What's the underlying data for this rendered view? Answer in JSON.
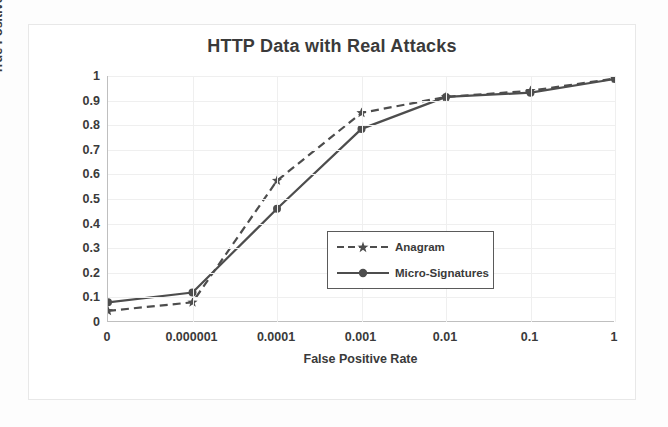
{
  "chart_data": {
    "type": "line",
    "title": "HTTP Data with Real Attacks",
    "xlabel": "False Positive Rate",
    "ylabel": "True Positive Rate",
    "x_tick_labels": [
      "0",
      "0.000001",
      "0.0001",
      "0.001",
      "0.01",
      "0.1",
      "1"
    ],
    "y_tick_labels": [
      "0",
      "0.1",
      "0.2",
      "0.3",
      "0.4",
      "0.5",
      "0.6",
      "0.7",
      "0.8",
      "0.9",
      "1"
    ],
    "y_ticks": [
      0,
      0.1,
      0.2,
      0.3,
      0.4,
      0.5,
      0.6,
      0.7,
      0.8,
      0.9,
      1
    ],
    "ylim": [
      0,
      1
    ],
    "x_scale": "categorical",
    "grid": true,
    "legend_position": "center-right-inside",
    "categories": [
      "0",
      "0.000001",
      "0.0001",
      "0.001",
      "0.01",
      "0.1",
      "1"
    ],
    "series": [
      {
        "name": "Anagram",
        "line_style": "dashed",
        "marker": "star",
        "color": "#4d4d4d",
        "values": [
          0.045,
          0.08,
          0.575,
          0.85,
          0.915,
          0.94,
          0.99
        ]
      },
      {
        "name": "Micro-Signatures",
        "line_style": "solid",
        "marker": "circle",
        "color": "#4d4d4d",
        "values": [
          0.08,
          0.12,
          0.46,
          0.785,
          0.915,
          0.932,
          0.988
        ]
      }
    ]
  },
  "legend": {
    "entries": [
      {
        "label": "Anagram"
      },
      {
        "label": "Micro-Signatures"
      }
    ]
  },
  "colors": {
    "series": "#4d4d4d",
    "grid": "#efefef",
    "axis": "#bfbfbf",
    "text": "#3a3a3a",
    "background": "#ffffff"
  }
}
